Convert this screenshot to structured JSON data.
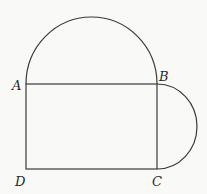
{
  "diagram": {
    "type": "geometry-figure",
    "points": {
      "A": {
        "label": "A",
        "x": 26,
        "y": 84
      },
      "B": {
        "label": "B",
        "x": 157,
        "y": 84
      },
      "C": {
        "label": "C",
        "x": 157,
        "y": 169
      },
      "D": {
        "label": "D",
        "x": 26,
        "y": 169
      }
    },
    "labels": {
      "A": "A",
      "B": "B",
      "C": "C",
      "D": "D"
    },
    "shapes": [
      {
        "kind": "rectangle",
        "vertices": [
          "A",
          "B",
          "C",
          "D"
        ]
      },
      {
        "kind": "semicircle",
        "diameter": [
          "A",
          "B"
        ],
        "side": "above"
      },
      {
        "kind": "semicircle",
        "diameter": [
          "B",
          "C"
        ],
        "side": "right"
      }
    ],
    "colors": {
      "stroke": "#3a3a3a",
      "background": "#f9f9f8",
      "label": "#2a2a2a"
    }
  }
}
